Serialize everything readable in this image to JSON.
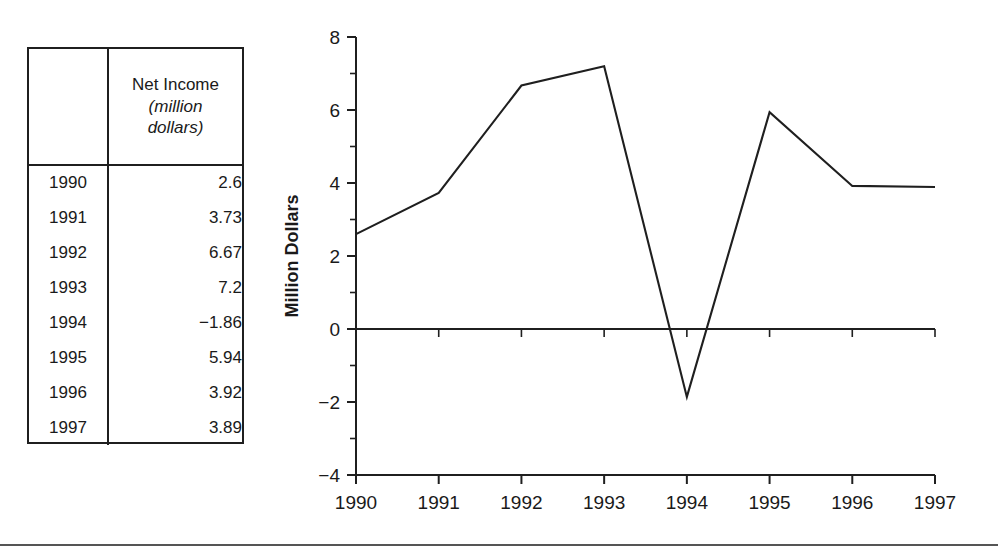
{
  "table": {
    "corner_header": "",
    "value_header": {
      "title": "Net Income",
      "subtitle_line1": "(million",
      "subtitle_line2": "dollars)"
    },
    "rows": [
      {
        "year": "1990",
        "value": "2.6"
      },
      {
        "year": "1991",
        "value": "3.73"
      },
      {
        "year": "1992",
        "value": "6.67"
      },
      {
        "year": "1993",
        "value": "7.2"
      },
      {
        "year": "1994",
        "value": "−1.86"
      },
      {
        "year": "1995",
        "value": "5.94"
      },
      {
        "year": "1996",
        "value": "3.92"
      },
      {
        "year": "1997",
        "value": "3.89"
      }
    ]
  },
  "chart_data": {
    "type": "line",
    "title": "",
    "xlabel": "",
    "ylabel": "Million Dollars",
    "categories": [
      "1990",
      "1991",
      "1992",
      "1993",
      "1994",
      "1995",
      "1996",
      "1997"
    ],
    "values": [
      2.6,
      3.73,
      6.67,
      7.2,
      -1.86,
      5.94,
      3.92,
      3.89
    ],
    "series": [
      {
        "name": "Net Income",
        "values": [
          2.6,
          3.73,
          6.67,
          7.2,
          -1.86,
          5.94,
          3.92,
          3.89
        ]
      }
    ],
    "ylim": [
      -4,
      8
    ],
    "ytick_labels": [
      "8",
      "6",
      "4",
      "2",
      "0",
      "−2",
      "−4"
    ],
    "ytick_values": [
      8,
      6,
      4,
      2,
      0,
      -2,
      -4
    ],
    "yminor_values": [
      7,
      5,
      3,
      1,
      -1,
      -3
    ],
    "xtick_labels": [
      "1990",
      "1991",
      "1992",
      "1993",
      "1994",
      "1995",
      "1996",
      "1997"
    ],
    "grid": false,
    "legend": "none",
    "zero_line": true,
    "line_color": "#1f1f1f"
  }
}
